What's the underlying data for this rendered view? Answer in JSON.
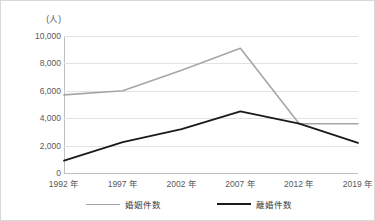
{
  "chart_data": {
    "type": "line",
    "title": "",
    "xlabel": "",
    "ylabel": "",
    "unit_label": "(人)",
    "categories": [
      "1992 年",
      "1997 年",
      "2002 年",
      "2007 年",
      "2012 年",
      "2019 年"
    ],
    "ylim": [
      0,
      10000
    ],
    "ytick_values": [
      0,
      2000,
      4000,
      6000,
      8000,
      10000
    ],
    "ytick_labels": [
      "0",
      "2,000",
      "4,000",
      "6,000",
      "8,000",
      "10,000"
    ],
    "grid": true,
    "legend_position": "bottom-center",
    "series": [
      {
        "name": "婚姻件数",
        "color": "#a6a6a6",
        "values": [
          5700,
          6000,
          7500,
          9100,
          3600,
          3600
        ]
      },
      {
        "name": "離婚件数",
        "color": "#1a1a1a",
        "values": [
          900,
          2250,
          3200,
          4500,
          3600,
          2200
        ]
      }
    ]
  },
  "frame": {
    "border_color": "#d9d9d9",
    "background": "#ffffff",
    "gridline_color": "#e2e2e2",
    "axis_color": "#bfbfbf"
  }
}
